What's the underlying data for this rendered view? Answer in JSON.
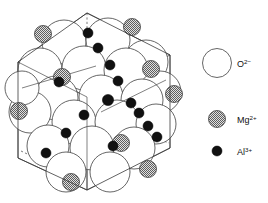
{
  "figure": {
    "background_color": "#ffffff",
    "line_color": "#3a3a3a"
  },
  "legend": {
    "position": "right",
    "items": [
      {
        "id": "oxygen",
        "symbol": "O",
        "charge": "2−",
        "label": "O",
        "sup": "2−",
        "marker": "large-open-circle",
        "radius": 14.5,
        "fill": "#ffffff",
        "stroke": "#4a4a4a",
        "cx": 27,
        "cy": 63,
        "label_x": 47,
        "label_y": 67
      },
      {
        "id": "magnesium",
        "symbol": "Mg",
        "charge": "2+",
        "label": "Mg",
        "sup": "2+",
        "marker": "hatched-gray-circle",
        "radius": 8.5,
        "fill": "#9c9c9c",
        "stroke": "#3c3c3c",
        "cx": 27,
        "cy": 119,
        "label_x": 47,
        "label_y": 123
      },
      {
        "id": "aluminium",
        "symbol": "Al",
        "charge": "3+",
        "label": "Al",
        "sup": "3+",
        "marker": "small-filled-black-circle",
        "radius": 5.0,
        "fill": "#111111",
        "stroke": "#000000",
        "cx": 27,
        "cy": 151,
        "label_x": 47,
        "label_y": 155
      }
    ]
  },
  "unit_cell": {
    "shape": "hexagonal-outline-cube-projection",
    "visible_edges": [
      "M 87 13 L 170 55 L 170 148 L 87 190 L 18 158 L 18 62 Z",
      "M 18 62 L 87 97 L 170 55",
      "M 87 97 L 87 190"
    ],
    "hidden_edges": [
      "M 87 13 L 87 33",
      "M 22 152 L 40 160",
      "M 158 138 L 168 142"
    ]
  },
  "atoms": {
    "oxygen": {
      "label": "O2-",
      "count": 20,
      "positions": [
        {
          "cx": 64,
          "cy": 42,
          "r": 22
        },
        {
          "cx": 108,
          "cy": 40,
          "r": 22
        },
        {
          "cx": 146,
          "cy": 62,
          "r": 22
        },
        {
          "cx": 40,
          "cy": 70,
          "r": 22
        },
        {
          "cx": 84,
          "cy": 68,
          "r": 22
        },
        {
          "cx": 126,
          "cy": 70,
          "r": 22
        },
        {
          "cx": 160,
          "cy": 92,
          "r": 21
        },
        {
          "cx": 56,
          "cy": 98,
          "r": 22
        },
        {
          "cx": 101,
          "cy": 97,
          "r": 22
        },
        {
          "cx": 142,
          "cy": 100,
          "r": 21
        },
        {
          "cx": 30,
          "cy": 112,
          "r": 21
        },
        {
          "cx": 74,
          "cy": 122,
          "r": 22
        },
        {
          "cx": 117,
          "cy": 122,
          "r": 22
        },
        {
          "cx": 156,
          "cy": 124,
          "r": 20
        },
        {
          "cx": 48,
          "cy": 146,
          "r": 21
        },
        {
          "cx": 92,
          "cy": 148,
          "r": 22
        },
        {
          "cx": 134,
          "cy": 148,
          "r": 21
        },
        {
          "cx": 66,
          "cy": 172,
          "r": 20
        },
        {
          "cx": 110,
          "cy": 172,
          "r": 20
        },
        {
          "cx": 22,
          "cy": 88,
          "r": 17
        }
      ]
    },
    "magnesium": {
      "label": "Mg2+",
      "count": 9,
      "positions": [
        {
          "cx": 43,
          "cy": 34,
          "r": 8.5
        },
        {
          "cx": 132,
          "cy": 27,
          "r": 8.5
        },
        {
          "cx": 151,
          "cy": 69,
          "r": 8.5
        },
        {
          "cx": 62,
          "cy": 77,
          "r": 8.5
        },
        {
          "cx": 174,
          "cy": 94,
          "r": 8.5
        },
        {
          "cx": 19,
          "cy": 111,
          "r": 8.5
        },
        {
          "cx": 121,
          "cy": 143,
          "r": 8.5
        },
        {
          "cx": 71,
          "cy": 182,
          "r": 8.5
        },
        {
          "cx": 148,
          "cy": 169,
          "r": 8.5
        }
      ]
    },
    "aluminium": {
      "label": "Al3+",
      "count": 14,
      "positions": [
        {
          "cx": 88,
          "cy": 33,
          "r": 5
        },
        {
          "cx": 98,
          "cy": 48,
          "r": 5
        },
        {
          "cx": 110,
          "cy": 65,
          "r": 5
        },
        {
          "cx": 118,
          "cy": 81,
          "r": 5
        },
        {
          "cx": 59,
          "cy": 82,
          "r": 5
        },
        {
          "cx": 108,
          "cy": 100,
          "r": 5.6
        },
        {
          "cx": 131,
          "cy": 103,
          "r": 5
        },
        {
          "cx": 139,
          "cy": 113,
          "r": 5
        },
        {
          "cx": 84,
          "cy": 115,
          "r": 5
        },
        {
          "cx": 148,
          "cy": 126,
          "r": 5
        },
        {
          "cx": 157,
          "cy": 137,
          "r": 5
        },
        {
          "cx": 66,
          "cy": 133,
          "r": 5
        },
        {
          "cx": 46,
          "cy": 153,
          "r": 5
        },
        {
          "cx": 113,
          "cy": 146,
          "r": 5
        }
      ]
    }
  }
}
